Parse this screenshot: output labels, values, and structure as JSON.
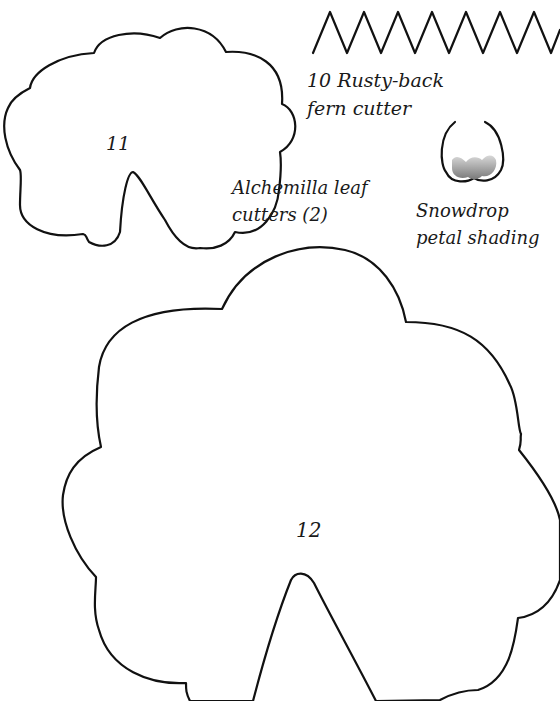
{
  "page": {
    "background": "#ffffff",
    "line_color": "#111111"
  },
  "templates": {
    "fern_cutter": {
      "label_line1": "10 Rusty-back",
      "label_line2": "fern cutter",
      "zigzag_peaks": 11
    },
    "alchemilla_small": {
      "number": "11"
    },
    "alchemilla_large": {
      "number": "12"
    },
    "alchemilla_label": {
      "line1": "Alchemilla leaf",
      "line2": "cutters (2)"
    },
    "snowdrop": {
      "label_line1": "Snowdrop",
      "label_line2": "petal shading",
      "shading_color": "#9a9a9a"
    }
  }
}
